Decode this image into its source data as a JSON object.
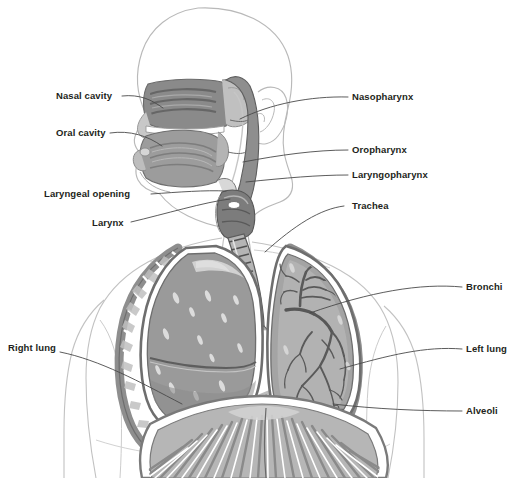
{
  "figure": {
    "background_color": "#ffffff",
    "width": 508,
    "height": 478
  },
  "palette": {
    "body_outline": "#b9b9b9",
    "label_text": "#231f20",
    "leader_line": "#4a4a4a",
    "tissue_dark": "#6f6f6f",
    "tissue_mid": "#8e8e8e",
    "tissue_light": "#a8a8a8",
    "tissue_pale": "#c4c4c4",
    "highlight": "#ffffff",
    "bronchi_tree": "#5a5a5a",
    "cavity_dark": "#7a7a7a"
  },
  "labels": [
    {
      "id": "nasal-cavity",
      "text": "Nasal cavity",
      "side": "left",
      "text_x": 56,
      "text_y": 99,
      "anchor": "start",
      "leader": "M 122 96 C 140 94 152 100 163 108"
    },
    {
      "id": "oral-cavity",
      "text": "Oral cavity",
      "side": "left",
      "text_x": 56,
      "text_y": 136,
      "anchor": "start",
      "leader": "M 110 133 C 130 130 148 136 162 146"
    },
    {
      "id": "laryngeal-opening",
      "text": "Laryngeal opening",
      "side": "left",
      "text_x": 44,
      "text_y": 197,
      "anchor": "start",
      "leader": "M 151 194 C 180 192 205 190 226 191"
    },
    {
      "id": "larynx",
      "text": "Larynx",
      "side": "left",
      "text_x": 92,
      "text_y": 226,
      "anchor": "start",
      "leader": "M 131 222 C 165 214 205 202 230 199"
    },
    {
      "id": "nasopharynx",
      "text": "Nasopharynx",
      "side": "right",
      "text_x": 352,
      "text_y": 100,
      "anchor": "start",
      "leader": "M 348 97 C 310 96 270 104 240 119"
    },
    {
      "id": "oropharynx",
      "text": "Oropharynx",
      "side": "right",
      "text_x": 352,
      "text_y": 153,
      "anchor": "start",
      "leader": "M 348 150 C 315 150 280 155 243 162"
    },
    {
      "id": "laryngopharynx",
      "text": "Laryngopharynx",
      "side": "right",
      "text_x": 352,
      "text_y": 178,
      "anchor": "start",
      "leader": "M 348 175 C 318 175 285 178 246 182"
    },
    {
      "id": "trachea",
      "text": "Trachea",
      "side": "right",
      "text_x": 352,
      "text_y": 209,
      "anchor": "start",
      "leader": "M 344 206 C 320 209 295 225 265 252"
    },
    {
      "id": "bronchi",
      "text": "Bronchi",
      "side": "right",
      "text_x": 466,
      "text_y": 290,
      "anchor": "start",
      "leader": "M 462 287 C 420 283 370 292 310 313"
    },
    {
      "id": "left-lung",
      "text": "Left lung",
      "side": "right",
      "text_x": 466,
      "text_y": 352,
      "anchor": "start",
      "leader": "M 462 349 C 425 346 390 355 340 369"
    },
    {
      "id": "alveoli",
      "text": "Alveoli",
      "side": "right",
      "text_x": 466,
      "text_y": 414,
      "anchor": "start",
      "leader": "M 462 411 C 420 411 375 409 333 404"
    },
    {
      "id": "right-lung",
      "text": "Right lung",
      "side": "left",
      "text_x": 8,
      "text_y": 351,
      "anchor": "start",
      "leader": "M 60 352 C 100 360 140 382 182 404"
    }
  ],
  "structures": [
    {
      "id": "head-outline",
      "name": "head and face profile outline"
    },
    {
      "id": "ear",
      "name": "outer ear"
    },
    {
      "id": "nasal-cavity-region",
      "name": "nasal cavity with turbinates"
    },
    {
      "id": "oral-cavity-region",
      "name": "oral cavity and tongue"
    },
    {
      "id": "pharynx",
      "name": "pharynx passage"
    },
    {
      "id": "larynx-region",
      "name": "larynx"
    },
    {
      "id": "trachea-tube",
      "name": "trachea with cartilage rings"
    },
    {
      "id": "right-lung-body",
      "name": "right lung with lobes"
    },
    {
      "id": "left-lung-body",
      "name": "left lung with bronchial tree"
    },
    {
      "id": "rib-cage",
      "name": "rib cage"
    },
    {
      "id": "diaphragm",
      "name": "diaphragm"
    },
    {
      "id": "torso-outline",
      "name": "torso and shoulders outline"
    }
  ]
}
